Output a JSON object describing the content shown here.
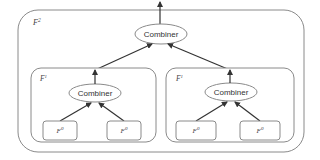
{
  "diagram": {
    "outer_box": {
      "label": "F",
      "superscript": "2"
    },
    "top_combiner": {
      "label": "Combiner"
    },
    "left_group": {
      "label": "F",
      "superscript": "1",
      "combiner": {
        "label": "Combiner"
      },
      "children": [
        {
          "label": "F",
          "superscript": "0"
        },
        {
          "label": "F",
          "superscript": "0"
        }
      ]
    },
    "right_group": {
      "label": "F",
      "superscript": "1",
      "combiner": {
        "label": "Combiner"
      },
      "children": [
        {
          "label": "F",
          "superscript": "0"
        },
        {
          "label": "F",
          "superscript": "0"
        }
      ]
    },
    "colors": {
      "stroke": "#8a8a8a",
      "arrow": "#333333",
      "box_fill": "#ffffff"
    }
  }
}
